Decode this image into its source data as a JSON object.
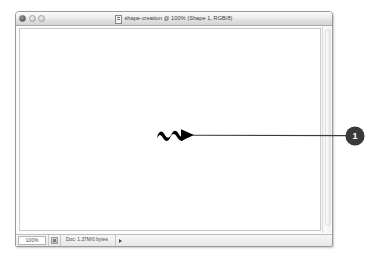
{
  "window": {
    "title": "shape-creation @ 100% (Shape 1, RGB/8)",
    "proxy_icon": "document-proxy-icon",
    "controls": {
      "close_label": "close-button",
      "minimize_label": "minimize-button",
      "zoom_label": "zoom-button"
    }
  },
  "canvas": {
    "shape_name": "squiggle-arrow-shape",
    "shape_color": "#000000",
    "background_color": "#ffffff"
  },
  "statusbar": {
    "zoom_value": "100%",
    "thumbnail_button": "thumbnail-toggle-button",
    "doc_info": "Doc: 1.37M/0 bytes",
    "arrow_button": "status-menu-arrow"
  },
  "annotation": {
    "badge_number": "1",
    "badge_color": "#3a3a3a",
    "leader_color": "#3a3a3a",
    "leader_label": "callout-leader-line"
  },
  "scrollbar": {
    "vertical_label": "vertical-scrollbar"
  }
}
